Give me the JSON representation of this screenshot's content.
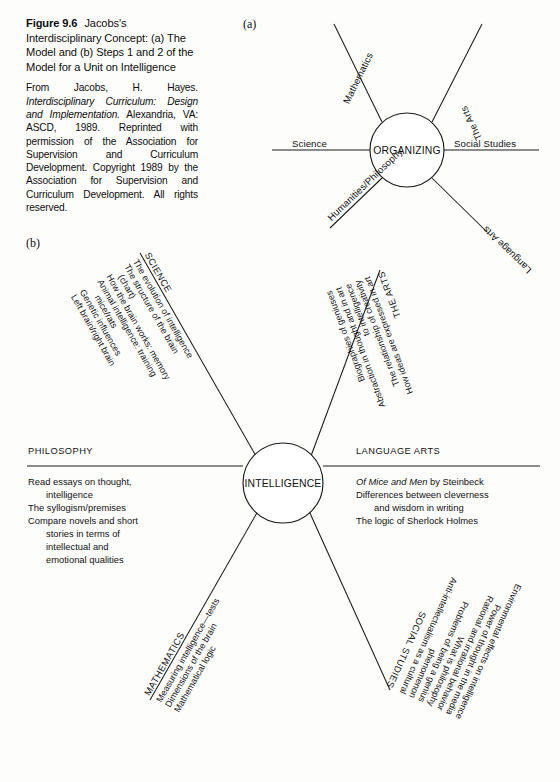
{
  "caption": {
    "figure_number": "Figure 9.6",
    "title": "Jacobs's Interdisciplinary Concept: (a) The Model and (b) Steps 1 and 2 of the Model for a Unit on Intelligence",
    "credit_pre": "From Jacobs, H. Hayes. ",
    "credit_italic": "Interdisciplinary Curriculum: Design and Implementation.",
    "credit_post": " Alexandria, VA: ASCD, 1989. Reprinted with permission of the Association for Supervision and Curriculum Development. Copyright 1989 by the Association for Supervision and Curriculum Development. All rights reserved."
  },
  "panel_a": {
    "letter": "(a)",
    "hub": "ORGANIZING",
    "spokes": [
      {
        "label": "Mathematics",
        "position": "upper-left"
      },
      {
        "label": "The Arts",
        "position": "upper-right"
      },
      {
        "label": "Science",
        "position": "left"
      },
      {
        "label": "Social Studies",
        "position": "right"
      },
      {
        "label": "Humanities/Philosophy",
        "position": "lower-left"
      },
      {
        "label": "Language Arts",
        "position": "lower-right"
      }
    ]
  },
  "panel_b": {
    "letter": "(b)",
    "hub": "INTELLIGENCE",
    "branches": [
      {
        "heading": "SCIENCE",
        "position": "upper-left",
        "items": [
          "The evolution of intelligence",
          "The structure of the brain",
          "(chart)",
          "How the brain works: memory",
          "Animal intelligence: training",
          "mice/rats",
          "Genetic influences",
          "Left brain/right brain"
        ]
      },
      {
        "heading": "THE ARTS",
        "position": "upper-right",
        "items": [
          "How ideas are expressed in art",
          "The relationship of creativity",
          "to intelligence",
          "Abstraction in thought and in art",
          "Biographies of geniuses"
        ]
      },
      {
        "heading": "PHILOSOPHY",
        "position": "left",
        "items": [
          "Read essays on thought,",
          "intelligence",
          "The syllogism/premises",
          "Compare novels and short",
          "stories in terms of",
          "intellectual and",
          "emotional qualities"
        ],
        "indents": [
          0,
          1,
          0,
          0,
          1,
          1,
          1
        ]
      },
      {
        "heading": "LANGUAGE ARTS",
        "position": "right",
        "items": [
          "Of Mice and Men by Steinbeck",
          "Differences between cleverness",
          "and wisdom in writing",
          "The logic of Sherlock Holmes"
        ],
        "indents": [
          0,
          0,
          1,
          0
        ],
        "italic_first_run": "Of Mice and Men",
        "italic_first_rest": " by Steinbeck"
      },
      {
        "heading": "MATHEMATICS",
        "position": "lower-left",
        "items": [
          "Measuring intelligence—tests",
          "Dimensions of the brain",
          "Mathematical logic"
        ]
      },
      {
        "heading": "SOCIAL STUDIES",
        "position": "lower-right",
        "items": [
          "Anti-intellectualism as a cultural",
          "phenomenon",
          "Problems of being a genius",
          "What is philosophy",
          "Rational and irrational behavior",
          "Power of thought in the media",
          "Environmental effects on intelligence"
        ]
      }
    ]
  },
  "colors": {
    "ink": "#101010",
    "paper": "#fdfdfc"
  }
}
